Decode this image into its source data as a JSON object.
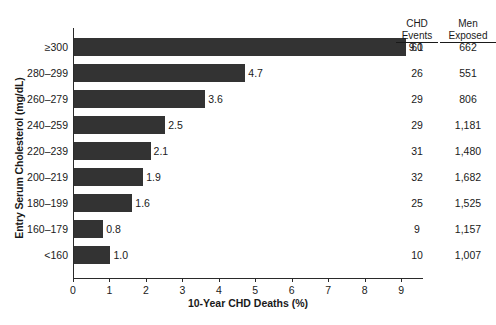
{
  "chart_data": {
    "type": "bar",
    "orientation": "horizontal",
    "title": "",
    "xlabel": "10-Year CHD Deaths (%)",
    "ylabel": "Entry Serum Cholesterol (mg/dL)",
    "xlim": [
      0,
      9.6
    ],
    "xticks": [
      0,
      1,
      2,
      3,
      4,
      5,
      6,
      7,
      8,
      9
    ],
    "xtick_labels": [
      "0",
      "1",
      "2",
      "3",
      "4",
      "5",
      "6",
      "7",
      "8",
      "9"
    ],
    "grid": false,
    "legend": "none",
    "bar_color": "#333333",
    "categories": [
      "≥300",
      "280–299",
      "260–279",
      "240–259",
      "220–239",
      "200–219",
      "180–199",
      "160–179",
      "<160"
    ],
    "values": [
      9.1,
      4.7,
      3.6,
      2.5,
      2.1,
      1.9,
      1.6,
      0.8,
      1.0
    ],
    "value_labels": [
      "9.1",
      "4.7",
      "3.6",
      "2.5",
      "2.1",
      "1.9",
      "1.6",
      "0.8",
      "1.0"
    ],
    "annotation_columns": [
      {
        "header_line1": "CHD",
        "header_line2": "Events",
        "values": [
          "60",
          "26",
          "29",
          "29",
          "31",
          "32",
          "25",
          "9",
          "10"
        ]
      },
      {
        "header_line1": "Men",
        "header_line2": "Exposed",
        "values": [
          "662",
          "551",
          "806",
          "1,181",
          "1,480",
          "1,682",
          "1,525",
          "1,157",
          "1,007"
        ]
      }
    ]
  }
}
